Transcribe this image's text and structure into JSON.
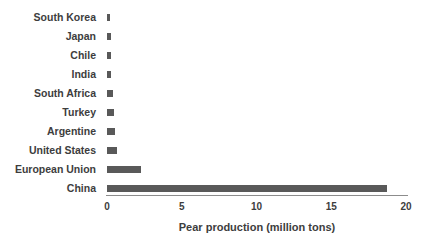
{
  "chart_data": {
    "type": "bar",
    "orientation": "horizontal",
    "title": "",
    "xlabel": "Pear production (million tons)",
    "ylabel": "",
    "categories": [
      "South Korea",
      "Japan",
      "Chile",
      "India",
      "South Africa",
      "Turkey",
      "Argentine",
      "United States",
      "European Union",
      "China"
    ],
    "values": [
      0.2,
      0.24,
      0.26,
      0.3,
      0.37,
      0.45,
      0.55,
      0.7,
      2.3,
      18.7
    ],
    "xlim": [
      0,
      20
    ],
    "xticks": [
      0,
      5,
      10,
      15,
      20
    ],
    "grid": false,
    "legend": "none",
    "bar_color": "#595959",
    "text_color": "#3d3d3d",
    "axis_color": "#8c8c8c",
    "background": "#ffffff"
  }
}
